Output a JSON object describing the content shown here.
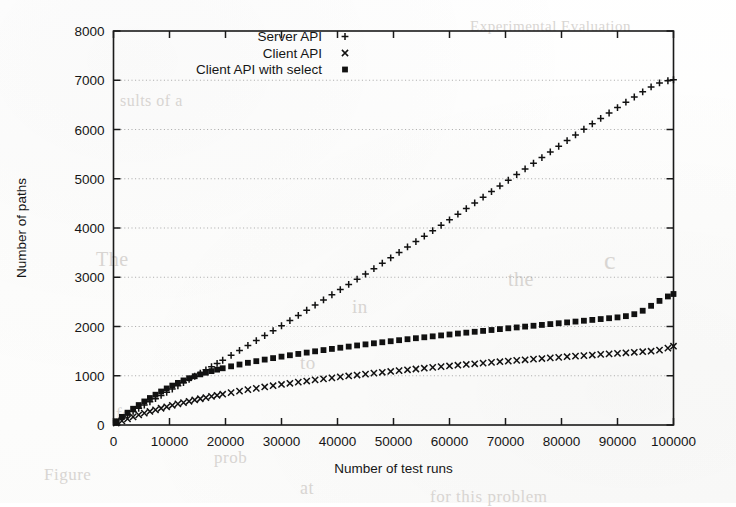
{
  "document": {
    "bleed_through_text": [
      {
        "text": "Experimental Evaluation",
        "x": 470,
        "y": 18,
        "size": 15
      },
      {
        "text": "c",
        "x": 604,
        "y": 246,
        "size": 26
      },
      {
        "text": "the",
        "x": 508,
        "y": 268,
        "size": 20
      },
      {
        "text": "to",
        "x": 300,
        "y": 352,
        "size": 19
      },
      {
        "text": "in",
        "x": 352,
        "y": 296,
        "size": 19
      },
      {
        "text": "sults of a",
        "x": 120,
        "y": 92,
        "size": 16
      },
      {
        "text": "The",
        "x": 96,
        "y": 248,
        "size": 20
      },
      {
        "text": "for",
        "x": 116,
        "y": 404,
        "size": 17
      },
      {
        "text": "prob",
        "x": 214,
        "y": 448,
        "size": 17
      },
      {
        "text": "at",
        "x": 300,
        "y": 478,
        "size": 18
      },
      {
        "text": "for this problem",
        "x": 430,
        "y": 487,
        "size": 17
      },
      {
        "text": "Figure",
        "x": 44,
        "y": 465,
        "size": 17
      }
    ]
  },
  "chart_data": {
    "type": "scatter",
    "title": "",
    "xlabel": "Number of test runs",
    "ylabel": "Number of paths",
    "xlim": [
      0,
      100000
    ],
    "ylim": [
      0,
      8000
    ],
    "xticks": [
      0,
      10000,
      20000,
      30000,
      40000,
      50000,
      60000,
      70000,
      80000,
      90000,
      100000
    ],
    "yticks": [
      0,
      1000,
      2000,
      3000,
      4000,
      5000,
      6000,
      7000,
      8000
    ],
    "xtick_labels": [
      "0",
      "10000",
      "20000",
      "30000",
      "40000",
      "50000",
      "60000",
      "70000",
      "80000",
      "90000",
      "100000"
    ],
    "ytick_labels": [
      "0",
      "1000",
      "2000",
      "3000",
      "4000",
      "5000",
      "6000",
      "7000",
      "8000"
    ],
    "grid": true,
    "grid_axis": "y",
    "legend_position": "top-right-inside",
    "plot_color": "#111111",
    "series": [
      {
        "name": "Server API",
        "marker": "plus",
        "x": [
          500,
          1500,
          2500,
          3500,
          4500,
          5500,
          6500,
          7500,
          8500,
          9500,
          10500,
          11500,
          12500,
          13500,
          14500,
          15500,
          16500,
          17500,
          18500,
          19500,
          21000,
          22500,
          24000,
          25500,
          27000,
          28500,
          30000,
          31500,
          33000,
          34500,
          36000,
          37500,
          39000,
          40500,
          42000,
          43500,
          45000,
          46500,
          48000,
          49500,
          51000,
          52500,
          54000,
          55500,
          57000,
          58500,
          60000,
          61500,
          63000,
          64500,
          66000,
          67500,
          69000,
          70500,
          72000,
          73500,
          75000,
          76500,
          78000,
          79500,
          81000,
          82500,
          84000,
          85500,
          87000,
          88500,
          90000,
          91500,
          93000,
          94500,
          96000,
          97500,
          99000,
          100000
        ],
        "y": [
          60,
          135,
          205,
          275,
          340,
          405,
          470,
          535,
          600,
          665,
          730,
          795,
          860,
          925,
          990,
          1055,
          1120,
          1185,
          1250,
          1315,
          1415,
          1515,
          1615,
          1715,
          1815,
          1915,
          2015,
          2120,
          2225,
          2330,
          2435,
          2540,
          2645,
          2750,
          2855,
          2960,
          3065,
          3175,
          3285,
          3395,
          3505,
          3615,
          3725,
          3835,
          3945,
          4055,
          4165,
          4280,
          4395,
          4510,
          4625,
          4740,
          4855,
          4970,
          5085,
          5200,
          5315,
          5430,
          5545,
          5660,
          5775,
          5890,
          6005,
          6115,
          6225,
          6335,
          6445,
          6555,
          6660,
          6765,
          6865,
          6945,
          6990,
          7010
        ]
      },
      {
        "name": "Client API",
        "marker": "cross",
        "x": [
          500,
          1500,
          2500,
          3500,
          4500,
          5500,
          6500,
          7500,
          8500,
          9500,
          10500,
          11500,
          12500,
          13500,
          14500,
          15500,
          16500,
          17500,
          18500,
          19500,
          21000,
          22500,
          24000,
          25500,
          27000,
          28500,
          30000,
          31500,
          33000,
          34500,
          36000,
          37500,
          39000,
          40500,
          42000,
          43500,
          45000,
          46500,
          48000,
          49500,
          51000,
          52500,
          54000,
          55500,
          57000,
          58500,
          60000,
          61500,
          63000,
          64500,
          66000,
          67500,
          69000,
          70500,
          72000,
          73500,
          75000,
          76500,
          78000,
          79500,
          81000,
          82500,
          84000,
          85500,
          87000,
          88500,
          90000,
          91500,
          93000,
          94500,
          96000,
          97500,
          99000,
          100000
        ],
        "y": [
          40,
          85,
          125,
          165,
          205,
          240,
          275,
          308,
          340,
          370,
          400,
          428,
          455,
          482,
          508,
          533,
          557,
          580,
          603,
          625,
          657,
          688,
          717,
          745,
          772,
          798,
          823,
          847,
          870,
          893,
          915,
          936,
          957,
          977,
          996,
          1015,
          1034,
          1052,
          1070,
          1087,
          1104,
          1121,
          1137,
          1153,
          1169,
          1184,
          1199,
          1214,
          1229,
          1243,
          1257,
          1271,
          1285,
          1298,
          1311,
          1324,
          1337,
          1350,
          1362,
          1374,
          1386,
          1398,
          1410,
          1421,
          1433,
          1444,
          1455,
          1466,
          1477,
          1488,
          1498,
          1520,
          1560,
          1600
        ]
      },
      {
        "name": "Client API with select",
        "marker": "filled-square",
        "x": [
          500,
          1500,
          2500,
          3500,
          4500,
          5500,
          6500,
          7500,
          8500,
          9500,
          10500,
          11500,
          12500,
          13500,
          14500,
          15500,
          16500,
          17500,
          18500,
          19500,
          21000,
          22500,
          24000,
          25500,
          27000,
          28500,
          30000,
          31500,
          33000,
          34500,
          36000,
          37500,
          39000,
          40500,
          42000,
          43500,
          45000,
          46500,
          48000,
          49500,
          51000,
          52500,
          54000,
          55500,
          57000,
          58500,
          60000,
          61500,
          63000,
          64500,
          66000,
          67500,
          69000,
          70500,
          72000,
          73500,
          75000,
          76500,
          78000,
          79500,
          81000,
          82500,
          84000,
          85500,
          87000,
          88500,
          90000,
          91500,
          93000,
          94500,
          96000,
          97500,
          99000,
          100000
        ],
        "y": [
          75,
          165,
          250,
          330,
          405,
          478,
          548,
          615,
          680,
          742,
          800,
          855,
          905,
          950,
          990,
          1028,
          1062,
          1094,
          1124,
          1152,
          1191,
          1228,
          1263,
          1296,
          1328,
          1358,
          1388,
          1416,
          1443,
          1470,
          1496,
          1521,
          1545,
          1569,
          1592,
          1615,
          1637,
          1659,
          1680,
          1701,
          1722,
          1742,
          1762,
          1781,
          1800,
          1819,
          1838,
          1857,
          1875,
          1893,
          1911,
          1929,
          1947,
          1964,
          1981,
          1998,
          2015,
          2032,
          2049,
          2066,
          2083,
          2100,
          2117,
          2134,
          2151,
          2168,
          2185,
          2210,
          2250,
          2320,
          2420,
          2520,
          2610,
          2660
        ]
      }
    ]
  }
}
